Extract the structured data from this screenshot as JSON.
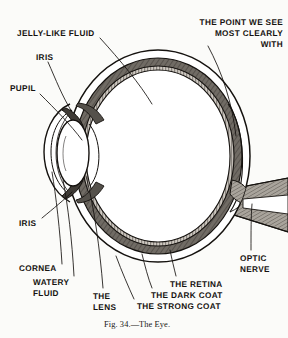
{
  "figure": {
    "caption": "Fig. 34.—The Eye.",
    "background_color": "#fbfbf9",
    "ink_color": "#15120f",
    "sclera_fill": "#ffffff",
    "choroid_fill": "#6f6a64",
    "retina_fill": "#c9c4bc",
    "vitreous_fill": "#ffffff",
    "nerve_fill": "#8d8880"
  },
  "labels": {
    "jelly_like_fluid": "JELLY-LIKE FLUID",
    "iris_top": "IRIS",
    "pupil": "PUPIL",
    "iris_bottom": "IRIS",
    "cornea": "CORNEA",
    "watery_fluid_line1": "WATERY",
    "watery_fluid_line2": "FLUID",
    "lens_line1": "THE",
    "lens_line2": "LENS",
    "point_line1": "THE POINT WE SEE",
    "point_line2": "MOST CLEARLY",
    "point_line3": "WITH",
    "retina": "THE RETINA",
    "dark_coat": "THE DARK COAT",
    "strong_coat": "THE STRONG COAT",
    "optic_line1": "OPTIC",
    "optic_line2": "NERVE"
  }
}
